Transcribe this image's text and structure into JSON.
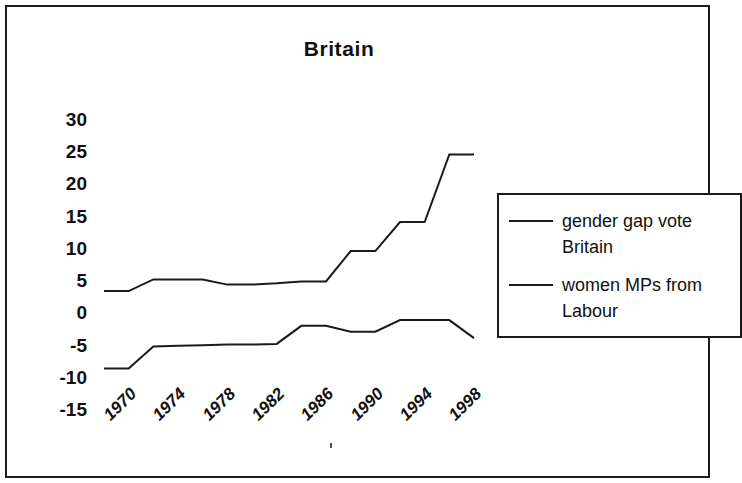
{
  "chart_data": {
    "type": "line",
    "title": "Britain",
    "xlabel": "",
    "ylabel": "",
    "x": [
      1970,
      1972,
      1974,
      1976,
      1978,
      1980,
      1982,
      1984,
      1986,
      1988,
      1990,
      1992,
      1994,
      1996,
      1998,
      2000
    ],
    "xtick_labels": [
      "1970",
      "1974",
      "1978",
      "1982",
      "1986",
      "1990",
      "1994",
      "1998"
    ],
    "xticks": [
      1970,
      1974,
      1978,
      1982,
      1986,
      1990,
      1994,
      1998
    ],
    "ytick_labels": [
      "30",
      "25",
      "20",
      "15",
      "10",
      "5",
      "0",
      "-5",
      "-10",
      "-15"
    ],
    "yticks": [
      30,
      25,
      20,
      15,
      10,
      5,
      0,
      -5,
      -10,
      -15
    ],
    "ylim": [
      -15,
      30
    ],
    "xlim": [
      1970,
      2000
    ],
    "grid": false,
    "legend_position": "right",
    "series": [
      {
        "name": "gender gap vote Britain",
        "color": "#1a1a1a",
        "values": [
          3.3,
          3.3,
          5.1,
          5.1,
          5.1,
          4.3,
          4.3,
          4.5,
          4.8,
          4.8,
          9.5,
          9.5,
          14.0,
          14.0,
          24.5,
          24.5
        ]
      },
      {
        "name": "women MPs from Labour",
        "color": "#1a1a1a",
        "values": [
          -8.7,
          -8.7,
          -5.3,
          -5.2,
          -5.1,
          -5.0,
          -5.0,
          -4.9,
          -2.1,
          -2.1,
          -3.0,
          -3.0,
          -1.2,
          -1.2,
          -1.2,
          -4.0
        ]
      }
    ]
  },
  "legend": {
    "entries": [
      {
        "label": "gender gap vote Britain"
      },
      {
        "label": "women MPs from Labour"
      }
    ]
  }
}
